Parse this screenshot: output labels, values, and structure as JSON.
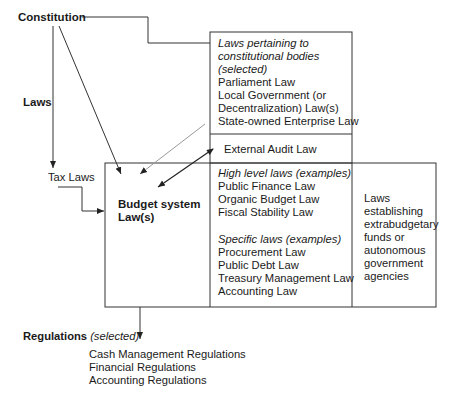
{
  "diagram": {
    "constitution_label": "Constitution",
    "laws_label": "Laws",
    "tax_laws_label": "Tax Laws",
    "budget_system_label": [
      "Budget system",
      "Law(s)"
    ],
    "constitutional_bodies_box": {
      "heading": [
        "Laws pertaining to",
        "constitutional bodies",
        "(selected)"
      ],
      "items": [
        "Parliament Law",
        "Local Government (or",
        "Decentralization) Law(s)",
        "State-owned Enterprise Law"
      ]
    },
    "external_audit_label": "External Audit Law",
    "high_level_laws": {
      "heading": "High level laws (examples)",
      "items": [
        "Public Finance Law",
        "Organic Budget Law",
        "Fiscal Stability Law"
      ]
    },
    "specific_laws": {
      "heading": "Specific laws (examples)",
      "items": [
        "Procurement Law",
        "Public Debt Law",
        "Treasury Management Law",
        "Accounting Law"
      ]
    },
    "extrabudgetary_box": [
      "Laws",
      "establishing",
      "extrabudgetary",
      "funds or",
      "autonomous",
      "government",
      "agencies"
    ],
    "regulations": {
      "label": "Regulations",
      "qualifier": "(selected)",
      "items": [
        "Cash Management Regulations",
        "Financial Regulations",
        "Accounting Regulations"
      ]
    },
    "colors": {
      "line": "#333333",
      "light_line": "#999999",
      "text": "#1a1a1a"
    }
  }
}
